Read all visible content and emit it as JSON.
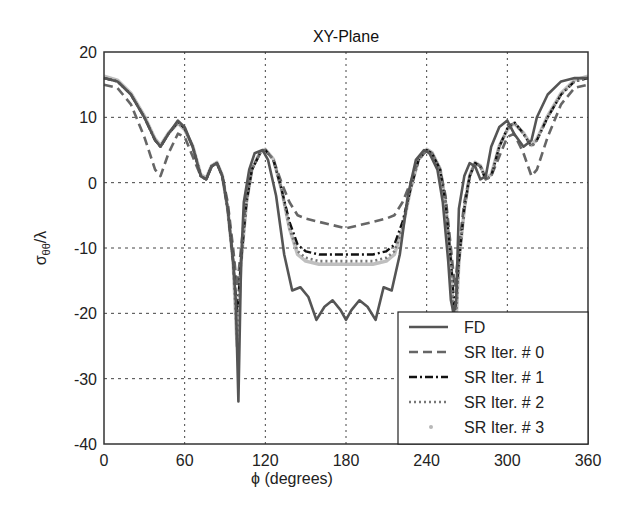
{
  "chart_data": {
    "type": "line",
    "title": "XY-Plane",
    "xlabel": "ϕ (degrees)",
    "ylabel": "σθθ/λ",
    "xlim": [
      0,
      360
    ],
    "ylim": [
      -40,
      20
    ],
    "xticks": [
      0,
      60,
      120,
      180,
      240,
      300,
      360
    ],
    "yticks": [
      20,
      10,
      0,
      -10,
      -20,
      -30,
      -40
    ],
    "grid": true,
    "legend_position": "lower right",
    "series": [
      {
        "name": "FD",
        "style": "solid",
        "color": "#555555",
        "x": [
          0,
          10,
          20,
          30,
          38,
          42,
          48,
          55,
          60,
          66,
          72,
          76,
          80,
          84,
          88,
          92,
          96,
          98,
          100,
          102,
          104,
          108,
          112,
          118,
          122,
          128,
          134,
          140,
          146,
          152,
          158,
          164,
          170,
          176,
          180,
          184,
          190,
          196,
          202,
          208,
          214,
          220,
          226,
          232,
          238,
          242,
          248,
          252,
          256,
          258,
          260,
          262,
          264,
          268,
          272,
          276,
          280,
          284,
          288,
          294,
          300,
          305,
          312,
          318,
          322,
          330,
          340,
          350,
          360
        ],
        "y": [
          16,
          15.5,
          13.5,
          10,
          6.5,
          5.5,
          7.5,
          9.5,
          8.5,
          5.5,
          1,
          0.5,
          2.5,
          3,
          1,
          -4,
          -12,
          -18,
          -33.5,
          -12,
          -3,
          2,
          4.5,
          5,
          3.5,
          -2,
          -11,
          -16.5,
          -16,
          -17.5,
          -21,
          -19,
          -18,
          -19.5,
          -21,
          -19.5,
          -18,
          -19,
          -21,
          -16,
          -16.5,
          -11,
          -2,
          3.5,
          5,
          4.5,
          2,
          -3,
          -12,
          -18,
          -20,
          -18,
          -4,
          1,
          3,
          2.5,
          0.5,
          1,
          5.5,
          8.5,
          9.5,
          7.5,
          5.5,
          6.5,
          10,
          13.5,
          15.5,
          16,
          16
        ]
      },
      {
        "name": "SR Iter. # 0",
        "style": "dashed",
        "color": "#666666",
        "x": [
          0,
          10,
          20,
          30,
          38,
          42,
          48,
          55,
          60,
          66,
          72,
          76,
          80,
          84,
          88,
          92,
          96,
          99,
          102,
          106,
          110,
          116,
          120,
          126,
          132,
          138,
          144,
          150,
          160,
          170,
          180,
          190,
          200,
          210,
          216,
          222,
          228,
          234,
          240,
          244,
          250,
          254,
          258,
          261,
          264,
          268,
          272,
          276,
          280,
          284,
          288,
          294,
          300,
          305,
          312,
          318,
          322,
          330,
          340,
          350,
          360
        ],
        "y": [
          15,
          14.5,
          12,
          7,
          2,
          1,
          4.5,
          7.5,
          7,
          4,
          1,
          0.5,
          2.5,
          3,
          1,
          -3,
          -10,
          -16,
          -10,
          -2,
          2,
          4.5,
          5,
          3.5,
          0,
          -3,
          -5,
          -5.5,
          -6,
          -6.5,
          -7,
          -6.5,
          -6,
          -5.5,
          -5,
          -3,
          0,
          3.5,
          5,
          4.5,
          2,
          -2,
          -10,
          -16,
          -10,
          -3,
          1,
          3,
          2.5,
          0.5,
          1,
          4,
          7,
          7.5,
          4.5,
          1,
          2,
          7,
          12,
          14.5,
          15
        ]
      },
      {
        "name": "SR Iter. # 1",
        "style": "dashdot",
        "color": "#111111",
        "x": [
          0,
          10,
          20,
          30,
          38,
          42,
          48,
          55,
          60,
          66,
          72,
          76,
          80,
          84,
          88,
          92,
          96,
          99,
          102,
          106,
          110,
          116,
          120,
          126,
          132,
          138,
          144,
          150,
          160,
          170,
          180,
          190,
          200,
          210,
          216,
          222,
          228,
          234,
          240,
          244,
          250,
          254,
          258,
          261,
          264,
          268,
          272,
          276,
          280,
          284,
          288,
          294,
          300,
          305,
          312,
          318,
          322,
          330,
          340,
          350,
          360
        ],
        "y": [
          16,
          15.5,
          13.5,
          10,
          6.5,
          5.5,
          7.5,
          9.3,
          8.3,
          5.5,
          1,
          0.5,
          2.5,
          3,
          1,
          -4,
          -12,
          -20,
          -12,
          -3,
          2,
          4.5,
          5,
          3.5,
          -1,
          -6,
          -9.5,
          -10.5,
          -11,
          -11,
          -11,
          -11,
          -11,
          -10.5,
          -9.5,
          -6,
          -1,
          3.5,
          5,
          4.5,
          2,
          -3,
          -12,
          -20,
          -12,
          -4,
          1,
          3,
          2.5,
          0.5,
          1,
          5.5,
          8.3,
          9.3,
          7.5,
          5.5,
          6.5,
          10,
          13.5,
          15.5,
          16
        ]
      },
      {
        "name": "SR Iter. # 2",
        "style": "dotted",
        "color": "#777777",
        "x": [
          0,
          10,
          20,
          30,
          38,
          42,
          48,
          55,
          60,
          66,
          72,
          76,
          80,
          84,
          88,
          92,
          96,
          99,
          102,
          106,
          110,
          116,
          120,
          126,
          132,
          138,
          144,
          150,
          160,
          170,
          180,
          190,
          200,
          210,
          216,
          222,
          228,
          234,
          240,
          244,
          250,
          254,
          258,
          261,
          264,
          268,
          272,
          276,
          280,
          284,
          288,
          294,
          300,
          305,
          312,
          318,
          322,
          330,
          340,
          350,
          360
        ],
        "y": [
          16,
          15.5,
          13.5,
          10,
          6.5,
          5.5,
          7.5,
          9.2,
          8.2,
          5.5,
          1,
          0.5,
          2.5,
          3,
          1,
          -4,
          -12,
          -24,
          -12,
          -3,
          2,
          4.5,
          5,
          3.5,
          -1,
          -7,
          -10.5,
          -11.5,
          -12,
          -12,
          -12,
          -12,
          -12,
          -11.5,
          -10.5,
          -7,
          -1,
          3.5,
          5,
          4.5,
          2,
          -3,
          -12,
          -24,
          -12,
          -4,
          1,
          3,
          2.5,
          0.5,
          1,
          5.5,
          8.2,
          9.2,
          7.5,
          5.5,
          6.5,
          10,
          13.5,
          15.5,
          16
        ]
      },
      {
        "name": "SR Iter. # 3",
        "style": "markers-light",
        "color": "#b8b8b8",
        "x": [
          0,
          10,
          20,
          30,
          38,
          42,
          48,
          55,
          60,
          66,
          72,
          76,
          80,
          84,
          88,
          92,
          96,
          99,
          102,
          106,
          110,
          116,
          120,
          126,
          132,
          138,
          144,
          150,
          160,
          170,
          180,
          190,
          200,
          210,
          216,
          222,
          228,
          234,
          240,
          244,
          250,
          254,
          258,
          261,
          264,
          268,
          272,
          276,
          280,
          284,
          288,
          294,
          300,
          305,
          312,
          318,
          322,
          330,
          340,
          350,
          360
        ],
        "y": [
          16.3,
          15.7,
          13.7,
          10.2,
          6.7,
          5.7,
          7.6,
          9.1,
          8.1,
          5.6,
          1.2,
          0.7,
          2.6,
          3.1,
          1.1,
          -4,
          -12,
          -25,
          -12,
          -3,
          2.1,
          4.6,
          5.1,
          3.6,
          -1,
          -7,
          -11,
          -12,
          -12.5,
          -12.5,
          -12.5,
          -12.5,
          -12.5,
          -12,
          -11,
          -7,
          -1,
          3.6,
          5.1,
          4.6,
          2.1,
          -3,
          -12,
          -25,
          -12,
          -4,
          1.1,
          3.1,
          2.6,
          0.7,
          1.2,
          5.6,
          8.1,
          9.1,
          7.6,
          5.7,
          6.7,
          10.2,
          13.7,
          15.7,
          16.3
        ]
      }
    ]
  },
  "legend": {
    "items": [
      "FD",
      "SR Iter. # 0",
      "SR Iter. # 1",
      "SR Iter. # 2",
      "SR Iter. # 3"
    ]
  }
}
